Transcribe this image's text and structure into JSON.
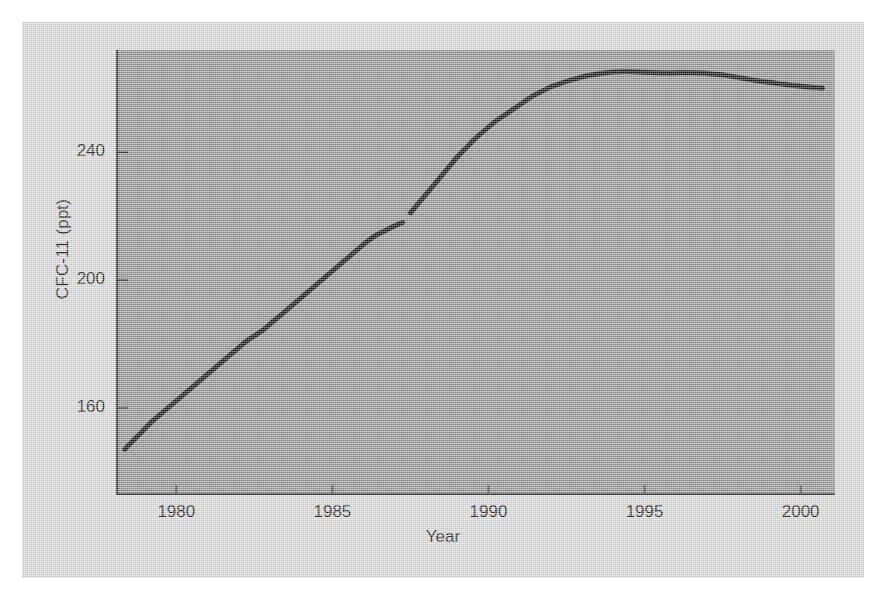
{
  "figure": {
    "background_color": "#d5d5d5",
    "plot_background_color": "#919191",
    "axis_color": "#2b2b2b",
    "series_color": "#111111"
  },
  "chart_data": {
    "type": "line",
    "title": "",
    "xlabel": "Year",
    "ylabel": "CFC-11 (ppt)",
    "xlim": [
      1978.1,
      2001.1
    ],
    "ylim": [
      133,
      272
    ],
    "xticks": [
      1980,
      1985,
      1990,
      1995,
      2000
    ],
    "xticklabels": [
      "1980",
      "1985",
      "1990",
      "1995",
      "2000"
    ],
    "yticks": [
      160,
      200,
      240
    ],
    "yticklabels": [
      "160",
      "200",
      "240"
    ],
    "grid": false,
    "legend": null,
    "series": [
      {
        "name": "CFC-11",
        "note": "gap in record near 1987.3",
        "x": [
          1978.35,
          1978.6,
          1978.9,
          1979.2,
          1979.5,
          1979.8,
          1980.1,
          1980.4,
          1980.7,
          1981.0,
          1981.3,
          1981.6,
          1981.9,
          1982.2,
          1982.5,
          1982.8,
          1983.1,
          1983.4,
          1983.7,
          1984.0,
          1984.3,
          1984.6,
          1984.9,
          1985.2,
          1985.5,
          1985.8,
          1986.1,
          1986.4,
          1986.7,
          1987.0,
          1987.25
        ],
        "y": [
          147.0,
          149.5,
          152.5,
          155.5,
          158.0,
          160.5,
          163.0,
          165.5,
          168.0,
          170.5,
          173.0,
          175.5,
          178.0,
          180.5,
          182.5,
          184.5,
          187.0,
          189.5,
          192.0,
          194.5,
          197.0,
          199.5,
          202.0,
          204.5,
          207.0,
          209.5,
          212.0,
          214.0,
          215.5,
          217.0,
          218.0
        ]
      },
      {
        "name": "CFC-11 (continued)",
        "note": "record resumes after 1987 gap",
        "x": [
          1987.5,
          1987.8,
          1988.1,
          1988.4,
          1988.7,
          1989.0,
          1989.3,
          1989.6,
          1989.9,
          1990.2,
          1990.5,
          1990.8,
          1991.1,
          1991.4,
          1991.7,
          1992.0,
          1992.3,
          1992.6,
          1992.9,
          1993.2,
          1993.5,
          1993.8,
          1994.1,
          1994.4,
          1994.7,
          1995.0,
          1995.3,
          1995.6,
          1995.9,
          1996.2,
          1996.5,
          1996.8,
          1997.1,
          1997.4,
          1997.7,
          1998.0,
          1998.3,
          1998.6,
          1998.9,
          1999.2,
          1999.5,
          1999.8,
          2000.1,
          2000.4,
          2000.7
        ],
        "y": [
          221.0,
          224.5,
          228.0,
          231.5,
          235.0,
          238.5,
          241.5,
          244.5,
          247.0,
          249.5,
          251.5,
          253.5,
          255.5,
          257.5,
          259.0,
          260.5,
          261.5,
          262.5,
          263.3,
          264.0,
          264.5,
          264.9,
          265.2,
          265.3,
          265.2,
          265.0,
          264.9,
          264.8,
          264.8,
          264.9,
          264.9,
          264.8,
          264.6,
          264.3,
          263.9,
          263.4,
          262.9,
          262.4,
          262.0,
          261.6,
          261.2,
          260.9,
          260.6,
          260.3,
          260.1
        ]
      }
    ]
  },
  "axis_titles": {
    "x": "Year",
    "y": "CFC-11 (ppt)"
  }
}
